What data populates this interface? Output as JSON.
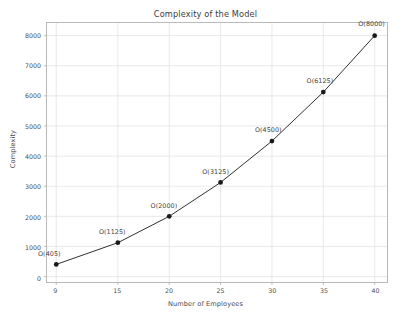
{
  "chart_data": {
    "type": "line",
    "title": "Complexity of the Model",
    "xlabel": "Number of Employees",
    "ylabel": "Complexity",
    "x": [
      9,
      15,
      20,
      25,
      30,
      35,
      40
    ],
    "values": [
      405,
      1125,
      2000,
      3125,
      4500,
      6125,
      8000
    ],
    "point_labels": [
      "O(405)",
      "O(1125)",
      "O(2000)",
      "O(3125)",
      "O(4500)",
      "O(6125)",
      "O(8000)"
    ],
    "xticks": [
      9,
      15,
      20,
      25,
      30,
      35,
      40
    ],
    "xtick_labels": [
      "9",
      "15",
      "20",
      "25",
      "30",
      "35",
      "40"
    ],
    "yticks": [
      0,
      1000,
      2000,
      3000,
      4000,
      5000,
      6000,
      7000,
      8000
    ],
    "ytick_labels": [
      "0",
      "1000",
      "2000",
      "3000",
      "4000",
      "5000",
      "6000",
      "7000",
      "8000"
    ],
    "xlim": [
      8.1,
      41.2
    ],
    "ylim": [
      -180,
      8420
    ],
    "grid": true,
    "legend": false,
    "colors": {
      "line": "#2f2f2f",
      "marker": "#1a1a1a",
      "grid": "#e3e3e3",
      "frame": "#b9b9b9",
      "background": "#ffffff",
      "text": "#3f3f3f"
    }
  }
}
